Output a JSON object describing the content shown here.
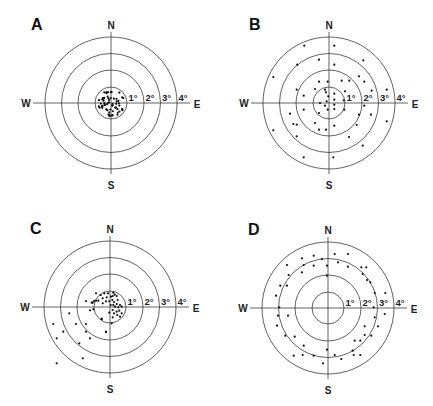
{
  "figure": {
    "background": "#ffffff",
    "line_color": "#3a3a3a",
    "dot_color": "#111111"
  },
  "compass_labels": {
    "north": "N",
    "south": "S",
    "west": "W",
    "east": "E"
  },
  "ring_labels": [
    "1°",
    "2°",
    "3°",
    "4°"
  ],
  "chart_data": [
    {
      "type": "scatter",
      "subtype": "polar-target",
      "title": "A",
      "center": [
        111,
        103
      ],
      "ring_radii_px": [
        16,
        33,
        49.5,
        66
      ],
      "ring_values_deg": [
        1,
        2,
        3,
        4
      ],
      "axis_labels": {
        "north": "N",
        "south": "S",
        "west": "W",
        "east": "E"
      },
      "description": "Dense cluster of ~60 points all within 1° of center",
      "cluster": {
        "count": 62,
        "max_radius_px": 13.5,
        "seed": 7
      },
      "points": []
    },
    {
      "type": "scatter",
      "subtype": "polar-target",
      "title": "B",
      "center": [
        329,
        103
      ],
      "ring_radii_px": [
        16,
        33,
        49.5,
        66
      ],
      "ring_values_deg": [
        1,
        2,
        3,
        4
      ],
      "axis_labels": {
        "north": "N",
        "south": "S",
        "west": "W",
        "east": "E"
      },
      "description": "Points scattered across all rings (0°–4°)",
      "points": [
        [
          -24.7,
          -57.3
        ],
        [
          5.3,
          -57.3
        ],
        [
          -55.7,
          -26
        ],
        [
          -31.7,
          -38.3
        ],
        [
          -10,
          -43.3
        ],
        [
          5.3,
          -38.3
        ],
        [
          34.3,
          -42.7
        ],
        [
          35.3,
          -21.3
        ],
        [
          -10,
          -21.3
        ],
        [
          -1.3,
          -21.3
        ],
        [
          12.7,
          -22.3
        ],
        [
          20.3,
          -22.3
        ],
        [
          30,
          -26.7
        ],
        [
          -32.3,
          -13.3
        ],
        [
          -25.3,
          -7.3
        ],
        [
          -14,
          -14
        ],
        [
          -4,
          -13.3
        ],
        [
          -3,
          -10.7
        ],
        [
          5.3,
          -9.3
        ],
        [
          16,
          -11.7
        ],
        [
          42.7,
          -12.3
        ],
        [
          57.7,
          -13.3
        ],
        [
          -2.3,
          -1.7
        ],
        [
          -4,
          2.7
        ],
        [
          5.3,
          -3.3
        ],
        [
          5.3,
          1.7
        ],
        [
          -1.3,
          6.7
        ],
        [
          5.3,
          6
        ],
        [
          -9,
          0
        ],
        [
          14.7,
          -2.7
        ],
        [
          15.3,
          6.7
        ],
        [
          35.3,
          2.7
        ],
        [
          -25.3,
          6.7
        ],
        [
          -10,
          10
        ],
        [
          30,
          11.7
        ],
        [
          42,
          11.7
        ],
        [
          57.7,
          18.3
        ],
        [
          -39,
          10.7
        ],
        [
          -35.7,
          21
        ],
        [
          -32.3,
          21.7
        ],
        [
          -14,
          20
        ],
        [
          5.3,
          22.7
        ],
        [
          -10,
          26.7
        ],
        [
          -3,
          26.7
        ],
        [
          27.7,
          22
        ],
        [
          -32.3,
          33.3
        ],
        [
          20,
          34
        ],
        [
          33.7,
          42.7
        ],
        [
          -55.7,
          27.3
        ],
        [
          -25.3,
          54.3
        ],
        [
          4.3,
          54.3
        ],
        [
          -0.7,
          -6.7
        ]
      ]
    },
    {
      "type": "scatter",
      "subtype": "polar-target",
      "title": "C",
      "center": [
        110,
        307
      ],
      "ring_radii_px": [
        16,
        33,
        49.5,
        66
      ],
      "ring_values_deg": [
        1,
        2,
        3,
        4
      ],
      "axis_labels": {
        "north": "N",
        "south": "S",
        "west": "W",
        "east": "E"
      },
      "description": "Central cluster within ~1° skewed to the upper-right, plus a tail of points in the lower-left (SW) quadrant out to ~4°",
      "points": [
        [
          -5.7,
          -13.7
        ],
        [
          -2,
          -13.7
        ],
        [
          3.3,
          -14.3
        ],
        [
          4.7,
          -12.3
        ],
        [
          -9.3,
          -12
        ],
        [
          -7.3,
          -8.7
        ],
        [
          -3.3,
          -9.7
        ],
        [
          1,
          -10.3
        ],
        [
          2.7,
          -11
        ],
        [
          6.7,
          -11
        ],
        [
          7.7,
          -7
        ],
        [
          2.3,
          -7
        ],
        [
          4,
          -5
        ],
        [
          -0.7,
          -5.7
        ],
        [
          -4,
          -5.7
        ],
        [
          -7.3,
          -3.7
        ],
        [
          -11.7,
          -6.3
        ],
        [
          -14,
          -6.3
        ],
        [
          -17.3,
          -4.3
        ],
        [
          0.7,
          -2
        ],
        [
          3.3,
          -2
        ],
        [
          6.7,
          -3
        ],
        [
          5,
          -0.3
        ],
        [
          8.3,
          0.3
        ],
        [
          10,
          -2
        ],
        [
          11.7,
          -0.3
        ],
        [
          9.3,
          3.7
        ],
        [
          6.7,
          4.7
        ],
        [
          2.7,
          3
        ],
        [
          4,
          6.3
        ],
        [
          7.3,
          8
        ],
        [
          11.7,
          6.3
        ],
        [
          10,
          9.7
        ],
        [
          -0.7,
          5.7
        ],
        [
          2.7,
          10.3
        ],
        [
          -16.7,
          2.3
        ],
        [
          -8.3,
          12.3
        ],
        [
          1.7,
          16.3
        ],
        [
          -18.3,
          -4.3
        ],
        [
          -14,
          -13.7
        ],
        [
          -24,
          -6
        ],
        [
          -20,
          3.3
        ],
        [
          -8.3,
          11.7
        ],
        [
          -16,
          -6
        ],
        [
          -4,
          25
        ],
        [
          -40.7,
          6.3
        ],
        [
          -56.7,
          17
        ],
        [
          -34,
          17
        ],
        [
          -24,
          17
        ],
        [
          -4,
          24.7
        ],
        [
          -46.7,
          24.7
        ],
        [
          -24,
          24.7
        ],
        [
          -53.3,
          31.3
        ],
        [
          -20,
          31.3
        ],
        [
          -30.7,
          36.3
        ],
        [
          -27.3,
          51.3
        ],
        [
          -53.3,
          56.3
        ]
      ]
    },
    {
      "type": "scatter",
      "subtype": "polar-target",
      "title": "D",
      "center": [
        328,
        308
      ],
      "ring_radii_px": [
        16,
        33,
        49.5,
        66
      ],
      "ring_values_deg": [
        1,
        2,
        3,
        4
      ],
      "axis_labels": {
        "north": "N",
        "south": "S",
        "west": "W",
        "east": "E"
      },
      "description": "Annulus of points between ~2.5° and ~4°, none near center",
      "points": [
        [
          -26,
          -49.7
        ],
        [
          -14.3,
          -52.3
        ],
        [
          6.7,
          -54
        ],
        [
          20,
          -54
        ],
        [
          -41,
          -43
        ],
        [
          -24.3,
          -43
        ],
        [
          -14.3,
          -42.3
        ],
        [
          -6,
          -49
        ],
        [
          -1,
          -42.3
        ],
        [
          10,
          -45.7
        ],
        [
          20,
          -41.3
        ],
        [
          33.3,
          -40.7
        ],
        [
          38.3,
          -40.7
        ],
        [
          -39.3,
          -33
        ],
        [
          -26,
          -35.7
        ],
        [
          -1,
          -32.3
        ],
        [
          34.7,
          -34
        ],
        [
          39,
          -28
        ],
        [
          -47.7,
          -22.3
        ],
        [
          -41,
          -22.3
        ],
        [
          42.3,
          -25.7
        ],
        [
          46.7,
          -15
        ],
        [
          57.3,
          -15
        ],
        [
          -52,
          -12.3
        ],
        [
          -48.7,
          -0.7
        ],
        [
          -40,
          7.7
        ],
        [
          -50,
          7.7
        ],
        [
          56.7,
          6
        ],
        [
          45.7,
          -0.7
        ],
        [
          -51,
          17.7
        ],
        [
          46.7,
          9.3
        ],
        [
          36.7,
          18.3
        ],
        [
          50,
          18.3
        ],
        [
          -42.7,
          27.7
        ],
        [
          -33.3,
          28.7
        ],
        [
          36.7,
          27
        ],
        [
          26.7,
          32.7
        ],
        [
          32.3,
          32.7
        ],
        [
          43.3,
          27.7
        ],
        [
          -24.3,
          37.7
        ],
        [
          -1,
          41.7
        ],
        [
          -34.3,
          47.7
        ],
        [
          -25.3,
          47
        ],
        [
          -14.3,
          47.7
        ],
        [
          6.7,
          47
        ],
        [
          13.3,
          51
        ],
        [
          24.7,
          42.7
        ],
        [
          25.7,
          47
        ],
        [
          32.3,
          47
        ],
        [
          -5,
          55.3
        ]
      ]
    }
  ]
}
